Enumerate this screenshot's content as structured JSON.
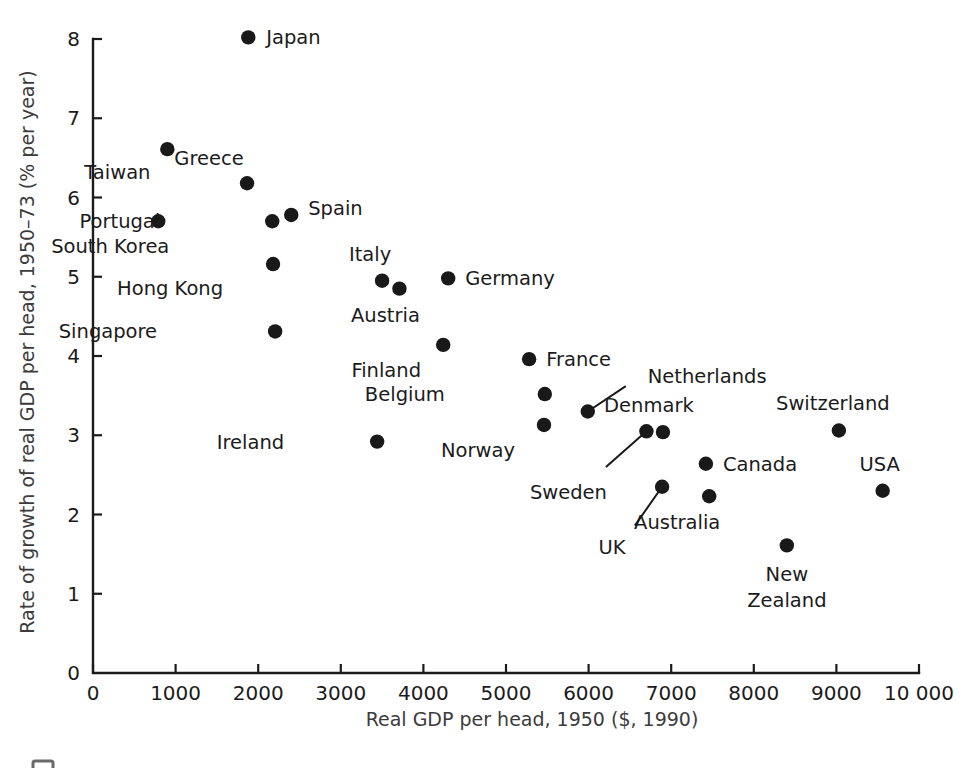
{
  "chart_data": {
    "type": "scatter",
    "title": "",
    "xlabel": "Real GDP per head, 1950 ($, 1990)",
    "ylabel": "Rate of growth of real GDP per head, 1950–73 (% per year)",
    "xlim": [
      0,
      10000
    ],
    "ylim": [
      0,
      8
    ],
    "xticks": [
      0,
      1000,
      2000,
      3000,
      4000,
      5000,
      6000,
      7000,
      8000,
      9000,
      10000
    ],
    "xticklabels": [
      "0",
      "1000",
      "2000",
      "3000",
      "4000",
      "5000",
      "6000",
      "7000",
      "8000",
      "9000",
      "10 000"
    ],
    "yticks": [
      0,
      1,
      2,
      3,
      4,
      5,
      6,
      7,
      8
    ],
    "yticklabels": [
      "0",
      "1",
      "2",
      "3",
      "4",
      "5",
      "6",
      "7",
      "8"
    ],
    "grid": false,
    "legend": false,
    "marker_color": "#191919",
    "points": [
      {
        "label": "Japan",
        "x": 1880,
        "y": 8.02,
        "label_pos": "right",
        "dx": 18,
        "dy": 7
      },
      {
        "label": "Taiwan",
        "x": 900,
        "y": 6.61,
        "label_pos": "below-left",
        "dx": -50,
        "dy": 30
      },
      {
        "label": "Greece",
        "x": 1865,
        "y": 6.18,
        "label_pos": "above",
        "dx": -38,
        "dy": -18
      },
      {
        "label": "Portugal",
        "x": 2170,
        "y": 5.7,
        "label_pos": "left",
        "dx": -112,
        "dy": 7
      },
      {
        "label": "South Korea",
        "x": 790,
        "y": 5.7,
        "label_pos": "below",
        "dx": -48,
        "dy": 32
      },
      {
        "label": "Spain",
        "x": 2400,
        "y": 5.78,
        "label_pos": "right",
        "dx": 17,
        "dy": 0
      },
      {
        "label": "Hong Kong",
        "x": 2180,
        "y": 5.16,
        "label_pos": "below-left",
        "dx": -103,
        "dy": 31
      },
      {
        "label": "Singapore",
        "x": 2205,
        "y": 4.31,
        "label_pos": "left",
        "dx": -118,
        "dy": 7
      },
      {
        "label": "Italy",
        "x": 3500,
        "y": 4.95,
        "label_pos": "above",
        "dx": -12,
        "dy": -20
      },
      {
        "label": "Austria",
        "x": 3710,
        "y": 4.85,
        "label_pos": "below",
        "dx": -14,
        "dy": 33
      },
      {
        "label": "Germany",
        "x": 4300,
        "y": 4.98,
        "label_pos": "right",
        "dx": 17,
        "dy": 7
      },
      {
        "label": "Finland",
        "x": 4240,
        "y": 4.14,
        "label_pos": "below-left",
        "dx": -57,
        "dy": 32
      },
      {
        "label": "France",
        "x": 5280,
        "y": 3.96,
        "label_pos": "right",
        "dx": 17,
        "dy": 7
      },
      {
        "label": "Belgium",
        "x": 5470,
        "y": 3.52,
        "label_pos": "left",
        "dx": -100,
        "dy": 7
      },
      {
        "label": "Norway",
        "x": 5460,
        "y": 3.13,
        "label_pos": "below-left",
        "dx": -66,
        "dy": 32
      },
      {
        "label": "Ireland",
        "x": 3440,
        "y": 2.92,
        "label_pos": "left",
        "dx": -93,
        "dy": 7
      },
      {
        "label": "Netherlands",
        "x": 5990,
        "y": 3.3,
        "label_pos": "leader",
        "dx": 60,
        "dy": -28
      },
      {
        "label": "Sweden",
        "x": 6700,
        "y": 3.05,
        "label_pos": "leader",
        "dx": -78,
        "dy": 68
      },
      {
        "label": "Denmark",
        "x": 6900,
        "y": 3.04,
        "label_pos": "above",
        "dx": -14,
        "dy": -20
      },
      {
        "label": "UK",
        "x": 6890,
        "y": 2.35,
        "label_pos": "leader",
        "dx": -50,
        "dy": 67
      },
      {
        "label": "Canada",
        "x": 7420,
        "y": 2.64,
        "label_pos": "right",
        "dx": 17,
        "dy": 7
      },
      {
        "label": "Australia",
        "x": 7460,
        "y": 2.23,
        "label_pos": "below-left",
        "dx": -32,
        "dy": 33
      },
      {
        "label": "Switzerland",
        "x": 9030,
        "y": 3.06,
        "label_pos": "above",
        "dx": -6,
        "dy": -20
      },
      {
        "label": "USA",
        "x": 9560,
        "y": 2.3,
        "label_pos": "above",
        "dx": -3,
        "dy": -20
      },
      {
        "label": "New Zealand",
        "x": 8400,
        "y": 1.61,
        "label_pos": "below",
        "dx": 0,
        "dy": 36
      }
    ],
    "leaders": [
      {
        "label": "Netherlands",
        "x1": 5990,
        "y1": 3.3,
        "x2": 6450,
        "y2": 3.62
      },
      {
        "label": "Sweden",
        "x1": 6700,
        "y1": 3.05,
        "x2": 6210,
        "y2": 2.6
      },
      {
        "label": "UK",
        "x1": 6890,
        "y1": 2.35,
        "x2": 6560,
        "y2": 1.86
      }
    ]
  }
}
